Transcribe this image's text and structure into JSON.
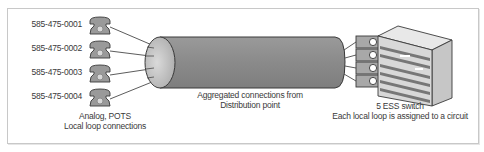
{
  "phones": [
    {
      "number": "585-475-0001"
    },
    {
      "number": "585-475-0002"
    },
    {
      "number": "585-475-0003"
    },
    {
      "number": "585-475-0004"
    }
  ],
  "captions": {
    "phones_line1": "Analog, POTS",
    "phones_line2": "Local loop connections",
    "trunk_line1": "Aggregated connections from",
    "trunk_line2": "Distribution point",
    "switch_line1": "5 ESS switch",
    "switch_line2": "Each local loop is assigned to a circuit"
  },
  "colors": {
    "phone_fill": "#9a9a9a",
    "cylinder_fill": "#8c8c8c",
    "cylinder_cap": "#c4c4c4",
    "switch_body": "#d4d4d4",
    "line": "#4a4a4a"
  }
}
